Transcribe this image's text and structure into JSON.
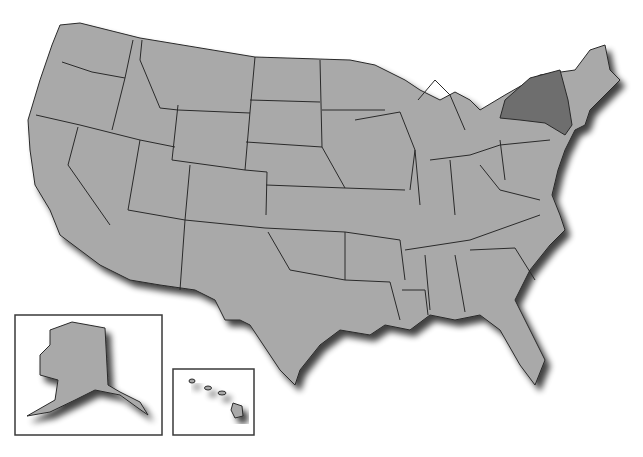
{
  "map": {
    "title": "",
    "region": "United States",
    "base_fill": "#a9a9a9",
    "highlight_fill": "#6e6e6e",
    "border_color": "#2a2a2a",
    "background": "#ffffff",
    "highlighted_states": [
      "New York"
    ],
    "insets": [
      {
        "name": "Alaska",
        "frame": [
          15,
          315,
          147,
          120
        ]
      },
      {
        "name": "Hawaii",
        "frame": [
          173,
          369,
          81,
          66
        ]
      }
    ]
  }
}
